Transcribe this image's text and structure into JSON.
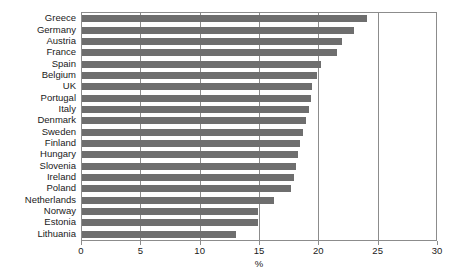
{
  "chart_data": {
    "type": "bar",
    "orientation": "horizontal",
    "title": "",
    "xlabel": "%",
    "ylabel": "",
    "xlim": [
      0,
      30
    ],
    "xticks": [
      0,
      5,
      10,
      15,
      20,
      25,
      30
    ],
    "xtick_labels": [
      "0",
      "5",
      "10",
      "15",
      "20",
      "25",
      "30"
    ],
    "grid": true,
    "grid_axis": "x",
    "legend": false,
    "bar_color": "#6e6e6e",
    "frame_color": "#8c8c8c",
    "categories": [
      "Greece",
      "Germany",
      "Austria",
      "France",
      "Spain",
      "Belgium",
      "UK",
      "Portugal",
      "Italy",
      "Denmark",
      "Sweden",
      "Finland",
      "Hungary",
      "Slovenia",
      "Ireland",
      "Poland",
      "Netherlands",
      "Norway",
      "Estonia",
      "Lithuania"
    ],
    "values": [
      24.0,
      22.9,
      21.9,
      21.5,
      20.1,
      19.8,
      19.4,
      19.3,
      19.1,
      18.9,
      18.6,
      18.4,
      18.2,
      18.0,
      17.9,
      17.6,
      16.2,
      14.8,
      14.8,
      13.0
    ],
    "axis_unit": "%"
  }
}
